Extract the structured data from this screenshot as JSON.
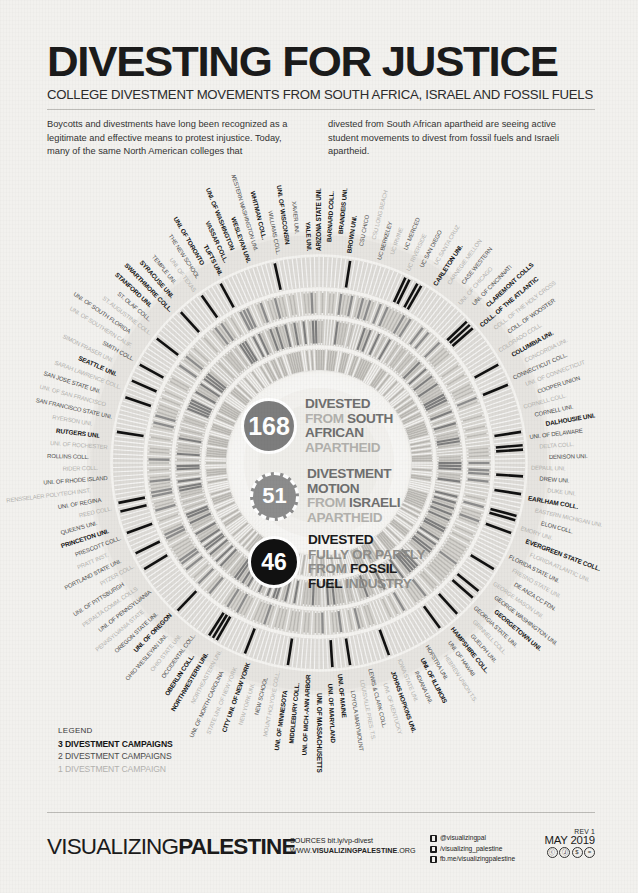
{
  "header": {
    "title": "DIVESTING FOR JUSTICE",
    "subtitle": "COLLEGE DIVESTMENT MOVEMENTS FROM SOUTH AFRICA, ISRAEL AND FOSSIL FUELS"
  },
  "intro": {
    "column_left": "Boycotts and divestments have long been recognized as a legitimate and effective means to protest injustice. Today, many of the same North American colleges that",
    "column_right": "divested from South African apartheid are seeing active student movements to divest from fossil fuels and Israeli apartheid."
  },
  "center_stats": [
    {
      "value": "168",
      "line1_a": "DIVESTED",
      "line1_b": "",
      "line2_a": "FROM ",
      "line2_b": "SOUTH",
      "line3_a": "AFRICAN",
      "line3_b": "",
      "line4_a": "APARTHEID",
      "color": "#7d7d7d",
      "ring_style": "solid"
    },
    {
      "value": "51",
      "line1_a": "DIVESTMENT",
      "line1_b": "",
      "line2_a": "MOTION",
      "line2_b": "",
      "line3_a": "FROM ",
      "line3_b": "ISRAELI",
      "line4_a": "APARTHEID",
      "color": "#8c8c8c",
      "ring_style": "dashed"
    },
    {
      "value": "46",
      "line1_a": "DIVESTED",
      "line1_b": "",
      "line2_a": "FULLY OR PARTLY",
      "line2_b": "",
      "line3_a": "FROM ",
      "line3_b": "FOSSIL",
      "line4_a": "FUEL ",
      "line4_b": "INDUSTRY",
      "color": "#111111",
      "ring_style": "solid"
    }
  ],
  "legend": {
    "title": "LEGEND",
    "three": "3 DIVESTMENT CAMPAIGNS",
    "two": "2 DIVESTMENT CAMPAIGNS",
    "one": "1 DIVESTMENT CAMPAIGN"
  },
  "footer": {
    "logo_thin": "VISUALIZING",
    "logo_bold": "PALESTINE",
    "sources_label": "SOURCES ",
    "sources_value": "bit.ly/vp-divest",
    "www_prefix": "WWW.",
    "www_bold": "VISUALIZINGPALESTINE",
    "www_suffix": ".ORG",
    "social": [
      "@visualizingpal",
      "/visualizing_palestine",
      "fb.me/visualizingpalestine"
    ],
    "rev": "REV 1",
    "date": "MAY 2019",
    "cc_badges": [
      "cc",
      "by",
      "nc",
      "nd"
    ]
  },
  "chart_data": {
    "type": "pie",
    "rings": [
      {
        "name": "DIVESTED FROM SOUTH AFRICAN APARTHEID",
        "count": 168,
        "color": "#7d7d7d",
        "radius_order": 1
      },
      {
        "name": "DIVESTMENT MOTION FROM ISRAELI APARTHEID",
        "count": 51,
        "color": "#8c8c8c",
        "radius_order": 2
      },
      {
        "name": "DIVESTED FULLY OR PARTLY FROM FOSSIL FUEL INDUSTRY",
        "count": 46,
        "color": "#111111",
        "radius_order": 3
      }
    ],
    "total_colleges": 288,
    "campaign_intensity_scale": {
      "3": "#141414",
      "2": "#4b4b4b",
      "1": "#b3b2ae"
    },
    "highlighted_colleges": [
      "STANFORD UNI.",
      "SEATTLE UNI.",
      "RUTGERS UNI.",
      "PRINCETON UNI.",
      "UNI. OF OREGON",
      "OBERLIN COLL.",
      "NORTHWESTERN UNI.",
      "CITY UNI. OF NEW YORK",
      "UNI. OF MINNESOTA",
      "MIDDLEBURY COLL.",
      "UNI. OF MICH.-ANN ARBOR",
      "UNI. OF MASSACHUSETTS",
      "UNI. OF MARYLAND",
      "UNI. OF MAINE",
      "UNI. OF ILLINOIS",
      "JOHNS HOPKINS UNI.",
      "HAMPSHIRE COLL.",
      "GEORGETOWN UNI.",
      "EVERGREEN STATE COLL.",
      "EARLHAM COLL.",
      "DALHOUSIE UNI.",
      "COLUMBIA UNI.",
      "COLL. OF THE ATLANTIC",
      "CLAREMONT COLLS",
      "CARLETON UNI.",
      "BROWN UNI.",
      "BRANDEIS UNI.",
      "BARNARD COLL.",
      "ARIZONA STATE UNI.",
      "YALE UNI.",
      "UNI. OF WISCONSIN",
      "WHITMAN COLL.",
      "WESLEYAN UNI.",
      "UNI. OF WASHINGTON",
      "VASSAR COLL.",
      "TUFTS UNI.",
      "UNI. OF TORONTO",
      "SYRACUSE UNI.",
      "SWARTHMORE COLL."
    ],
    "label_ring": [
      "ARIZONA STATE UNI.",
      "BARNARD COLL.",
      "BRANDEIS UNI.",
      "BROWN UNI.",
      "CSU CHICO",
      "CSU LONG BEACH",
      "UC BERKELEY",
      "UC IRVINE",
      "UC MERCED",
      "UC RIVERSIDE",
      "UC SAN DIEGO",
      "UC SANTA CRUZ",
      "CARLETON UNI.",
      "CARNEGIE MELLON",
      "CASE WESTERN",
      "UNI. OF CHICAGO",
      "UNI. OF CINCINNATI",
      "CLAREMONT COLLS",
      "COLL. OF THE ATLANTIC",
      "COLL. OF THE HOLY CROSS",
      "COLL. OF WOOSTER",
      "COLORADO COLL.",
      "COLUMBIA UNI.",
      "CONCORDIA UNI.",
      "CONNECTICUT COLL.",
      "UNI. OF CONNECTICUT",
      "COOPER UNION",
      "CORNELL COLL.",
      "CORNELL UNI.",
      "DALHOUSIE UNI.",
      "UNI. OF DELAWARE",
      "DELTA COLL.",
      "DENISON UNI.",
      "DEPAUL UNI.",
      "DREW UNI.",
      "DUKE UNI.",
      "EARLHAM COLL.",
      "EASTERN MICHIGAN UNI.",
      "ELON COLL.",
      "EMORY UNI.",
      "EVERGREEN STATE COLL.",
      "FLORIDA ATLANTIC UNI.",
      "FLORIDA STATE UNI.",
      "FRESNO STATE UNI.",
      "DE ANZA CC FDN.",
      "GEORGE MASON UNI.",
      "GEORGE WASHINGTON UNI.",
      "GEORGETOWN UNI.",
      "GEORGIA STATE UNI.",
      "GRINNELL COLL.",
      "GUELPH UNI.",
      "HAMPSHIRE COLL.",
      "UNI. OF HAWAII",
      "HEBREW UNION T.S.",
      "HOFSTRA UNI.",
      "UNI. OF ILLINOIS",
      "INDIANA UNI.",
      "IOWA STATE UNI.",
      "JOHNS HOPKINS UNI.",
      "UNI. OF KENTUCKY",
      "LEWIS & CLARK COLL.",
      "LOUISVILLE PRES. T.S.",
      "LOYOLA MARYMOUNT",
      "UNI. OF MAINE",
      "UNI. OF MARYLAND",
      "UNI. OF MASSACHUSETTS",
      "UNI. OF MICH.-ANN ARBOR",
      "MIDDLEBURY COLL.",
      "UNI. OF MINNESOTA",
      "MOUNT HOLYOKE COLL.",
      "NEW SCHOOL",
      "NEW YORK UNI.",
      "CITY UNI. OF NEW YORK",
      "STATE UNI. OF NEW YORK",
      "UNI. OF NORTH CAROLINA",
      "NORTHEASTERN UNI.",
      "NORTHWESTERN UNI.",
      "OBERLIN COLL.",
      "OCCIDENTAL COLL.",
      "OHIO STATE UNI.",
      "OHIO WESLEYAN UNI.",
      "UNI. OF OREGON",
      "OREGON STATE UNI.",
      "PENNSYLVANIA STATE",
      "UNI. OF PENNSYLVANIA",
      "PERALTA COMM. COLLS",
      "UNI. OF PITTSBURGH",
      "PITZER COLL.",
      "PORTLAND STATE UNI.",
      "PRATT INST.",
      "PRESCOTT COLL.",
      "PRINCETON UNI.",
      "QUEEN'S UNI.",
      "REED COLL.",
      "UNI. OF REGINA",
      "RENSSELAER POLYTECH INST.",
      "UNI. OF RHODE ISLAND",
      "RIDER COLL.",
      "ROLLINS COLL.",
      "UNI. OF ROCHESTER",
      "RUTGERS UNI.",
      "RYERSON UNI.",
      "SAN FRANCISCO STATE UNI.",
      "UNI. OF SAN FRANCISCO",
      "SAN JOSE STATE UNI.",
      "SARAH LAWRENCE COLL.",
      "SEATTLE UNI.",
      "SIMON FRASER UNI.",
      "SMITH COLL.",
      "UNI. OF SOUTHERN CALIF.",
      "UNI. OF SOUTH FLORIDA",
      "ST. AUGUSTINE COLL.",
      "ST. OLAF COLL.",
      "STANFORD UNI.",
      "SWARTHMORE COLL.",
      "SYRACUSE UNI.",
      "TEMPLE UNI.",
      "UNI. OF TEXAS",
      "THE NEW SCHOOL",
      "UNI. OF TORONTO",
      "TUFTS UNI.",
      "VASSAR COLL.",
      "UNI. OF WASHINGTON",
      "WESLEYAN UNI.",
      "WESTERN WASHINGTON UNI.",
      "WHITMAN COLL.",
      "WILLIAMS COLL.",
      "UNI. OF WISCONSIN",
      "XAVIER UNI.",
      "YALE UNI."
    ]
  }
}
